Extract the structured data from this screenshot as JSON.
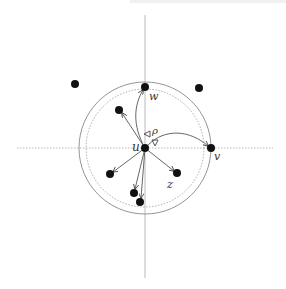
{
  "figure": {
    "width": 286,
    "height": 289,
    "colors": {
      "axis": "#aaaaaa",
      "circle": "#888888",
      "node": "#111111",
      "edge": "#555555",
      "label": "#333333"
    },
    "axes": {
      "horizontal": {
        "x1": 17,
        "y1": 148,
        "x2": 273,
        "y2": 148,
        "style": "dotted"
      },
      "vertical": {
        "x1": 145,
        "y1": 15,
        "x2": 145,
        "y2": 278,
        "style": "solid"
      }
    },
    "circles": [
      {
        "name": "outer-range-circle",
        "cx": 145,
        "cy": 148,
        "r": 66,
        "style": "solid"
      },
      {
        "name": "inner-range-circle",
        "cx": 145,
        "cy": 148,
        "r": 59,
        "style": "dotted"
      }
    ],
    "nodes": [
      {
        "id": "u",
        "x": 145,
        "y": 148,
        "label": "u"
      },
      {
        "id": "w",
        "x": 145,
        "y": 87,
        "label": "w"
      },
      {
        "id": "v",
        "x": 211,
        "y": 148,
        "label": "v"
      },
      {
        "id": "z",
        "x": 177,
        "y": 173,
        "label": "z"
      },
      {
        "id": "n1",
        "x": 119,
        "y": 110,
        "label": ""
      },
      {
        "id": "n2",
        "x": 110,
        "y": 174,
        "label": ""
      },
      {
        "id": "n3",
        "x": 134,
        "y": 193,
        "label": ""
      },
      {
        "id": "n4",
        "x": 140,
        "y": 202,
        "label": ""
      },
      {
        "id": "n5",
        "x": 75,
        "y": 84,
        "label": ""
      },
      {
        "id": "n6",
        "x": 199,
        "y": 88,
        "label": ""
      }
    ],
    "edges": [
      {
        "from": "u",
        "to": "w",
        "curved": true
      },
      {
        "from": "u",
        "to": "v",
        "curved": true
      },
      {
        "from": "u",
        "to": "z",
        "curved": false
      },
      {
        "from": "u",
        "to": "n1",
        "curved": false
      },
      {
        "from": "u",
        "to": "n2",
        "curved": false
      },
      {
        "from": "u",
        "to": "n3",
        "curved": false
      },
      {
        "from": "u",
        "to": "n4",
        "curved": false
      }
    ],
    "labels": {
      "u": "u",
      "w": "w",
      "v": "v",
      "z": "z",
      "rho": "ρ",
      "triangle_down": "∇"
    }
  }
}
